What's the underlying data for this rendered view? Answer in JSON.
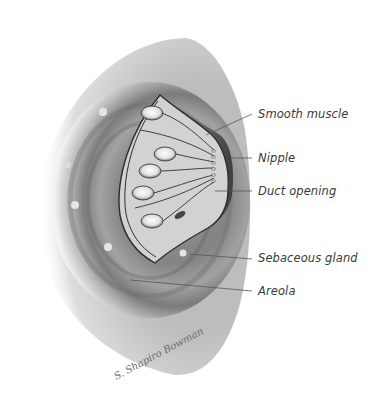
{
  "figure": {
    "labels": [
      {
        "id": "smooth-muscle",
        "text": "Smooth muscle",
        "x": 258,
        "y": 107,
        "line": [
          206,
          135,
          252,
          114
        ]
      },
      {
        "id": "nipple",
        "text": "Nipple",
        "x": 258,
        "y": 151,
        "line": [
          230,
          158,
          252,
          158
        ]
      },
      {
        "id": "duct-opening",
        "text": "Duct opening",
        "x": 258,
        "y": 184,
        "line": [
          215,
          191,
          252,
          191
        ]
      },
      {
        "id": "sebaceous-gland",
        "text": "Sebaceous gland",
        "x": 258,
        "y": 251,
        "line": [
          190,
          254,
          252,
          259
        ]
      },
      {
        "id": "areola",
        "text": "Areola",
        "x": 258,
        "y": 284,
        "line": [
          130,
          280,
          252,
          291
        ]
      }
    ],
    "signature": "S. Shapiro Bowman"
  },
  "colors": {
    "background": "#ffffff",
    "label_text": "#3a3a3a",
    "leader_line": "#555555",
    "skin_dark": "#6e6e6e",
    "skin_light": "#d8d8d8"
  }
}
